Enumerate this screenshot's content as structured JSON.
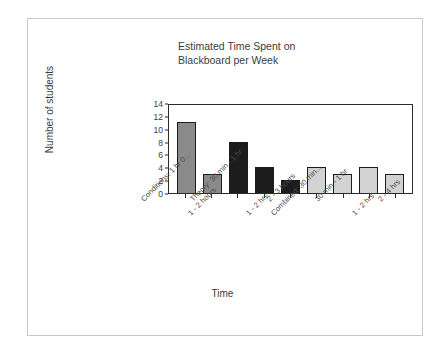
{
  "chart_data": {
    "type": "bar",
    "title": "Estimated Time Spent on\nBlackboard per Week",
    "xlabel": "Time",
    "ylabel": "Number of students",
    "ylim": [
      0,
      14
    ],
    "ytick_step": 2,
    "yticks": [
      0,
      2,
      4,
      6,
      8,
      10,
      12,
      14
    ],
    "grid": false,
    "legend": "none",
    "categories": [
      "Conditions: 1 hr 0...",
      "1 - 2 hours",
      "Theory: 30 min - 1 hr",
      "1 - 2 hrs",
      "2 - 3 hours",
      "Combined: 30 min...",
      "30 min - 1 hr",
      "1 - 2 hrs",
      "2 - 4 hrs"
    ],
    "values": [
      11,
      3,
      8,
      4,
      2,
      4,
      3,
      4,
      3
    ],
    "bar_colors": [
      "#8a8a8a",
      "#8a8a8a",
      "#1c1c1c",
      "#1c1c1c",
      "#1c1c1c",
      "#d2d2d2",
      "#d2d2d2",
      "#d2d2d2",
      "#d2d2d2"
    ],
    "groups": [
      {
        "name": "Conditions",
        "color": "#8a8a8a"
      },
      {
        "name": "Theory",
        "color": "#1c1c1c"
      },
      {
        "name": "Combined",
        "color": "#d2d2d2"
      }
    ]
  }
}
